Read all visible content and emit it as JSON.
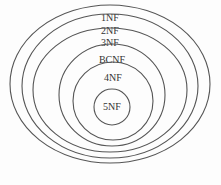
{
  "diagram": {
    "type": "nested-ellipses",
    "rings": [
      {
        "label": "1NF",
        "cx": 110,
        "cy": 84,
        "rx": 100,
        "ry": 79,
        "label_y": 21
      },
      {
        "label": "2NF",
        "cx": 110,
        "cy": 86,
        "rx": 88,
        "ry": 72,
        "label_y": 34
      },
      {
        "label": "3NF",
        "cx": 110,
        "cy": 90,
        "rx": 77,
        "ry": 62,
        "label_y": 46
      },
      {
        "label": "BCNF",
        "cx": 112,
        "cy": 95,
        "rx": 53,
        "ry": 51,
        "label_y": 63
      },
      {
        "label": "4NF",
        "cx": 113,
        "cy": 101,
        "rx": 40,
        "ry": 39,
        "label_y": 81
      },
      {
        "label": "5NF",
        "cx": 112,
        "cy": 107,
        "rx": 18,
        "ry": 18,
        "label_y": 110
      }
    ],
    "stroke_color": "#555555",
    "text_color": "#333333",
    "background": "#fdfdfd"
  }
}
